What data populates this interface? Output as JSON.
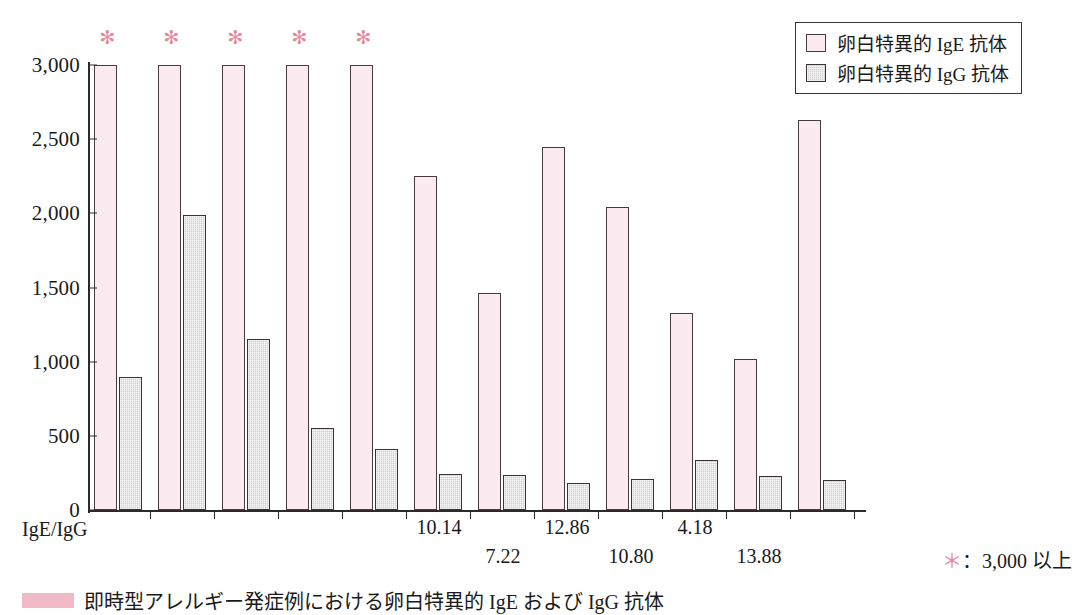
{
  "chart_data": {
    "type": "bar",
    "title": "",
    "xlabel": "IgE/IgG",
    "ylabel": "",
    "ylim": [
      0,
      3000
    ],
    "ytick_values": [
      3000,
      2500,
      2000,
      1500,
      1000,
      500,
      0
    ],
    "ytick_labels": [
      "3,000",
      "2,500",
      "2,000",
      "1,500",
      "1,000",
      "500",
      "0"
    ],
    "grid": false,
    "legend_position": "top-right",
    "categories": [
      "1",
      "2",
      "3",
      "4",
      "5",
      "6",
      "7",
      "8",
      "9",
      "10"
    ],
    "series": [
      {
        "name": "卵白特異的 IgE 抗体",
        "color": "#fbeaef",
        "values": [
          3000,
          3000,
          3000,
          3000,
          3000,
          2255,
          1465,
          2450,
          2040,
          1330
        ]
      },
      {
        "name": "卵白特異的 IgG 抗体",
        "color": "#cfcfcf",
        "values": [
          900,
          1990,
          1150,
          555,
          410,
          240,
          235,
          185,
          210,
          335
        ]
      }
    ],
    "extra_groups": [
      {
        "ige": 1015,
        "igg": 230
      },
      {
        "ige": 2630,
        "igg": 205
      }
    ],
    "annotations": {
      "asterisk_groups": [
        1,
        2,
        3,
        4,
        5
      ],
      "asterisk_glyph": "✻",
      "ratio_labels": [
        {
          "group": 6,
          "value": "10.14",
          "row": 0
        },
        {
          "group": 7,
          "value": "7.22",
          "row": 1
        },
        {
          "group": 8,
          "value": "12.86",
          "row": 0
        },
        {
          "group": 9,
          "value": "10.80",
          "row": 1
        },
        {
          "group": 10,
          "value": "4.18",
          "row": 0
        },
        {
          "group": 11,
          "value": "13.88",
          "row": 1
        }
      ]
    }
  },
  "legend": {
    "items": [
      {
        "label": "卵白特異的 IgE 抗体",
        "swatch": "ige"
      },
      {
        "label": "卵白特異的 IgG 抗体",
        "swatch": "igg"
      }
    ]
  },
  "axis": {
    "x_title": "IgE/IgG",
    "y_labels": [
      "3,000",
      "2,500",
      "2,000",
      "1,500",
      "1,000",
      "500",
      "0"
    ]
  },
  "footnote": {
    "star": "＊",
    "text": "：3,000 以上"
  },
  "caption": {
    "text": "即時型アレルギー発症例における卵白特異的 IgE および IgG 抗体"
  }
}
